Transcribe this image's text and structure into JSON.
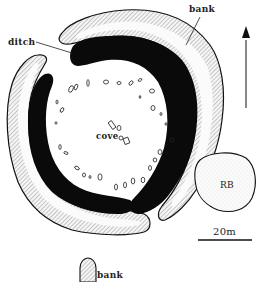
{
  "diagram": {
    "type": "archaeological site plan",
    "labels": {
      "ditch": "ditch",
      "bank_top": "bank",
      "cove": "cove",
      "rb": "RB",
      "scale": "20m",
      "bank_bottom": "bank"
    },
    "north_arrow": "north-arrow",
    "colors": {
      "ditch_fill": "#0a0a0a",
      "bank_fill": "#f4f4f4",
      "bank_hatch": "#777777",
      "outline": "#111111",
      "background": "#ffffff"
    }
  }
}
